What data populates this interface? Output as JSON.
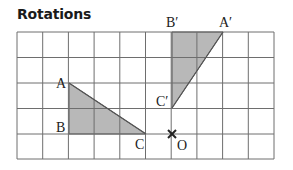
{
  "title": "Rotations",
  "grid": {
    "cols": 10,
    "rows": 5,
    "line_color": "#6e6e6e"
  },
  "shape_fill": "#b8b8b8",
  "original_triangle": {
    "labels": {
      "A": "A",
      "B": "B",
      "C": "C"
    }
  },
  "rotated_triangle": {
    "labels": {
      "A": "A′",
      "B": "B′",
      "C": "C′"
    }
  },
  "centre": {
    "label": "O",
    "marker": "×"
  }
}
